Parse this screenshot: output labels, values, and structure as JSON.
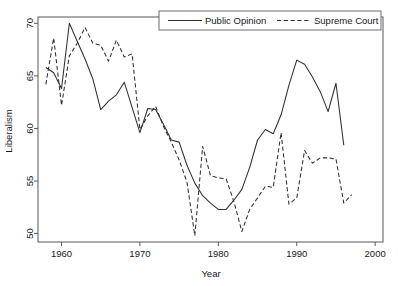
{
  "chart_data": {
    "type": "line",
    "title": "",
    "xlabel": "Year",
    "ylabel": "Liberalism",
    "xlim": [
      1957,
      2001
    ],
    "ylim": [
      49.2,
      70.6
    ],
    "xticks": [
      1960,
      1970,
      1980,
      1990,
      2000
    ],
    "yticks": [
      50,
      55,
      60,
      65,
      70
    ],
    "grid": false,
    "legend_position": "top-center",
    "series": [
      {
        "name": "Public Opinion",
        "style": "solid",
        "color": "#2b2f33",
        "x": [
          1958,
          1959,
          1960,
          1961,
          1962,
          1963,
          1964,
          1965,
          1966,
          1967,
          1968,
          1969,
          1970,
          1971,
          1972,
          1973,
          1974,
          1975,
          1976,
          1977,
          1978,
          1979,
          1980,
          1981,
          1982,
          1983,
          1984,
          1985,
          1986,
          1987,
          1988,
          1989,
          1990,
          1991,
          1992,
          1993,
          1994,
          1995,
          1996
        ],
        "y": [
          65.8,
          65.3,
          63.8,
          70.0,
          68.3,
          66.6,
          64.7,
          61.8,
          62.6,
          63.2,
          64.4,
          62.0,
          59.6,
          61.9,
          61.8,
          60.4,
          58.9,
          58.7,
          56.5,
          54.8,
          53.6,
          52.9,
          52.3,
          52.3,
          53.2,
          54.2,
          56.3,
          58.9,
          59.9,
          59.5,
          61.3,
          64.1,
          66.5,
          66.1,
          64.9,
          63.5,
          61.6,
          64.3,
          58.4
        ]
      },
      {
        "name": "Supreme Court",
        "style": "dashed",
        "color": "#2b2f33",
        "x": [
          1958,
          1959,
          1960,
          1961,
          1962,
          1963,
          1964,
          1965,
          1966,
          1967,
          1968,
          1969,
          1970,
          1971,
          1972,
          1973,
          1974,
          1975,
          1976,
          1977,
          1978,
          1979,
          1980,
          1981,
          1982,
          1983,
          1984,
          1985,
          1986,
          1987,
          1988,
          1989,
          1990,
          1991,
          1992,
          1993,
          1994,
          1995,
          1996,
          1997
        ],
        "y": [
          64.2,
          68.6,
          62.2,
          66.9,
          68.1,
          69.6,
          68.1,
          67.9,
          66.4,
          68.4,
          66.8,
          67.1,
          59.9,
          61.2,
          62.1,
          60.2,
          58.7,
          57.0,
          54.9,
          49.8,
          58.3,
          55.5,
          55.3,
          55.2,
          53.0,
          50.2,
          52.3,
          53.4,
          54.5,
          54.4,
          59.6,
          52.8,
          53.4,
          57.9,
          56.7,
          57.2,
          57.2,
          57.1,
          52.9,
          53.7
        ]
      }
    ],
    "legend": [
      {
        "label": "Public Opinion",
        "style": "solid"
      },
      {
        "label": "Supreme Court",
        "style": "dashed"
      }
    ]
  }
}
